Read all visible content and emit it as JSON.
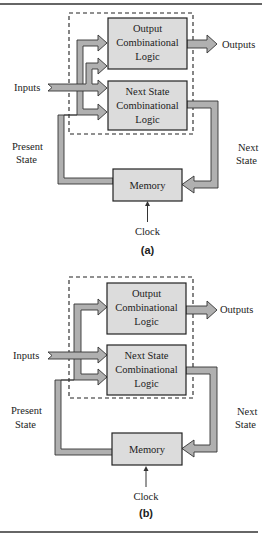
{
  "figure": {
    "diagrams": [
      {
        "caption": "(a)",
        "blocks": {
          "output_logic": [
            "Output",
            "Combinational",
            "Logic"
          ],
          "next_state_logic": [
            "Next State",
            "Combinational",
            "Logic"
          ],
          "memory": "Memory"
        },
        "labels": {
          "inputs": "Inputs",
          "outputs": "Outputs",
          "present_state": [
            "Present",
            "State"
          ],
          "next_state": [
            "Next",
            "State"
          ],
          "clock": "Clock"
        }
      },
      {
        "caption": "(b)",
        "blocks": {
          "output_logic": [
            "Output",
            "Combinational",
            "Logic"
          ],
          "next_state_logic": [
            "Next State",
            "Combinational",
            "Logic"
          ],
          "memory": "Memory"
        },
        "labels": {
          "inputs": "Inputs",
          "outputs": "Outputs",
          "present_state": [
            "Present",
            "State"
          ],
          "next_state": [
            "Next",
            "State"
          ],
          "clock": "Clock"
        }
      }
    ],
    "colors": {
      "block_fill": "#dcdcdc",
      "bus_fill": "#b0b0b0",
      "outline": "#222222"
    }
  }
}
